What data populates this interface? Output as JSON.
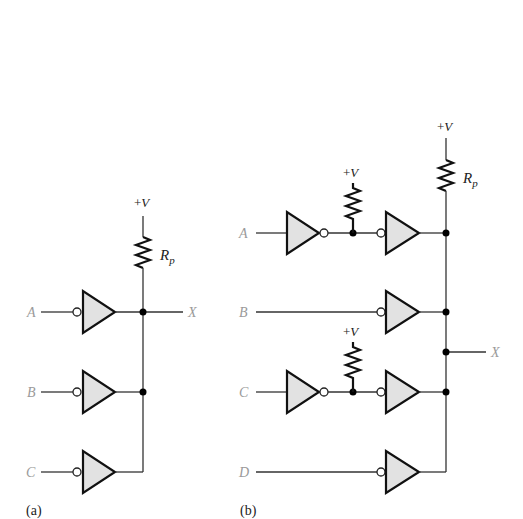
{
  "figure": {
    "panels": [
      {
        "id": "a",
        "caption": "(a)",
        "supply": {
          "plus": "+",
          "v": "V"
        },
        "resistor": {
          "label_main": "R",
          "label_sub": "p"
        },
        "inputs": [
          "A",
          "B",
          "C"
        ],
        "output": "X",
        "gate_type": "open-collector inverting buffer (wired-AND)"
      },
      {
        "id": "b",
        "caption": "(b)",
        "supply": {
          "plus": "+",
          "v": "V"
        },
        "resistor": {
          "label_main": "R",
          "label_sub": "p"
        },
        "local_pullups": [
          {
            "plus": "+",
            "v": "V"
          },
          {
            "plus": "+",
            "v": "V"
          }
        ],
        "inputs": [
          "A",
          "B",
          "C",
          "D"
        ],
        "output": "X",
        "gate_type": "open-collector buffers with inverter stages on A and C"
      }
    ]
  },
  "colors": {
    "gate_fill": "#e2e2e2",
    "stroke": "#111111",
    "signal_label": "#9a9a9a"
  }
}
